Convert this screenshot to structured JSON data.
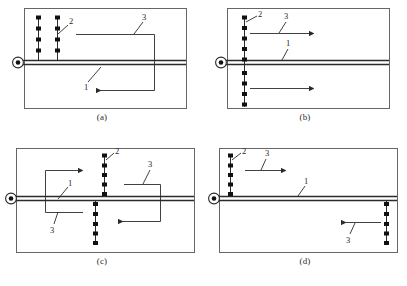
{
  "figure": {
    "title": "",
    "panel_count": 4,
    "colors": {
      "line": "#2b2b2b",
      "border": "#555555",
      "shaft": "#3a3a3a",
      "marker": "#111111",
      "background": "#ffffff"
    },
    "legend_keys": {
      "1": "1",
      "2": "2",
      "3": "3"
    }
  },
  "panels": [
    {
      "id": "a",
      "caption": "(a)",
      "pivot_symbol": "bearing-pivot",
      "vertical_arrays": [
        {
          "name": "array-left",
          "marker_count": 4
        },
        {
          "name": "array-right",
          "marker_count": 4
        }
      ],
      "labels": [
        {
          "key": "2",
          "text": "2",
          "target": "marker-array"
        },
        {
          "key": "3",
          "text": "3",
          "target": "bracket-path"
        },
        {
          "key": "1",
          "text": "1",
          "target": "shaft"
        }
      ],
      "arrows": [
        {
          "name": "arrow-left",
          "direction": "left"
        }
      ],
      "brackets": [
        {
          "name": "bracket-open-left",
          "opening": "left"
        }
      ]
    },
    {
      "id": "b",
      "caption": "(b)",
      "pivot_symbol": "bearing-pivot",
      "vertical_arrays": [
        {
          "name": "array-center",
          "marker_count": 9
        }
      ],
      "labels": [
        {
          "key": "2",
          "text": "2",
          "target": "marker-array"
        },
        {
          "key": "3",
          "text": "3",
          "target": "arrow-upper"
        },
        {
          "key": "1",
          "text": "1",
          "target": "shaft"
        }
      ],
      "arrows": [
        {
          "name": "arrow-upper-right",
          "direction": "right"
        },
        {
          "name": "arrow-lower-right",
          "direction": "right"
        }
      ],
      "brackets": []
    },
    {
      "id": "c",
      "caption": "(c)",
      "pivot_symbol": "bearing-pivot",
      "vertical_arrays": [
        {
          "name": "array-upper",
          "marker_count": 5
        },
        {
          "name": "array-lower",
          "marker_count": 5
        }
      ],
      "labels": [
        {
          "key": "2",
          "text": "2",
          "target": "marker-array-upper"
        },
        {
          "key": "1",
          "text": "1",
          "target": "shaft"
        },
        {
          "key": "3",
          "text": "3",
          "target": "bracket-left"
        },
        {
          "key": "3",
          "text": "3",
          "target": "bracket-right"
        }
      ],
      "arrows": [
        {
          "name": "arrow-upper-right",
          "direction": "right"
        },
        {
          "name": "arrow-lower-left",
          "direction": "left"
        }
      ],
      "brackets": [
        {
          "name": "bracket-open-right",
          "opening": "right"
        },
        {
          "name": "bracket-open-left",
          "opening": "left"
        }
      ]
    },
    {
      "id": "d",
      "caption": "(d)",
      "pivot_symbol": "bearing-pivot",
      "vertical_arrays": [
        {
          "name": "array-upper-left",
          "marker_count": 5
        },
        {
          "name": "array-lower-right",
          "marker_count": 5
        }
      ],
      "labels": [
        {
          "key": "2",
          "text": "2",
          "target": "marker-array-upper-left"
        },
        {
          "key": "3",
          "text": "3",
          "target": "arrow-upper"
        },
        {
          "key": "1",
          "text": "1",
          "target": "shaft"
        },
        {
          "key": "3",
          "text": "3",
          "target": "arrow-lower"
        }
      ],
      "arrows": [
        {
          "name": "arrow-upper-right",
          "direction": "right"
        },
        {
          "name": "arrow-lower-left",
          "direction": "left"
        }
      ],
      "brackets": []
    }
  ]
}
